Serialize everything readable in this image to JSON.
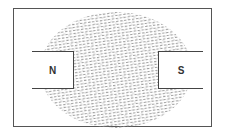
{
  "diagram": {
    "poles": [
      {
        "label": "N",
        "side": "left"
      },
      {
        "label": "S",
        "side": "right"
      }
    ],
    "field_pattern": "iron-filings-dashes",
    "colors": {
      "frame": "#555555",
      "filings": "#8a8a8a",
      "magnet_border": "#444444",
      "background": "#ffffff"
    }
  }
}
